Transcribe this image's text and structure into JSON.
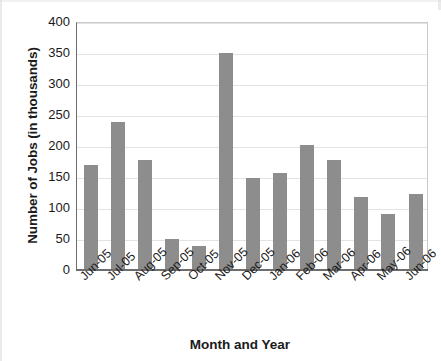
{
  "chart_data": {
    "type": "bar",
    "title": "",
    "xlabel": "Month and Year",
    "ylabel": "Number of Jobs (in thousands)",
    "categories": [
      "Jun-05",
      "Jul-05",
      "Aug-05",
      "Sep-05",
      "Oct-05",
      "Nov-05",
      "Dec-05",
      "Jan-06",
      "Feb-06",
      "Mar-06",
      "Apr-06",
      "May-06",
      "Jun-06"
    ],
    "values": [
      170,
      239,
      178,
      50,
      38,
      350,
      148,
      156,
      201,
      178,
      118,
      91,
      123
    ],
    "ylim": [
      0,
      400
    ],
    "yticks": [
      0,
      50,
      100,
      150,
      200,
      250,
      300,
      350,
      400
    ],
    "ytick_labels": [
      "0",
      "50",
      "100",
      "150",
      "200",
      "250",
      "300",
      "350",
      "400"
    ],
    "grid": true,
    "legend": false,
    "bar_color": "#8d8d8d",
    "axis_color": "#6d6d6d",
    "gridline_color": "#e3e3e3"
  }
}
